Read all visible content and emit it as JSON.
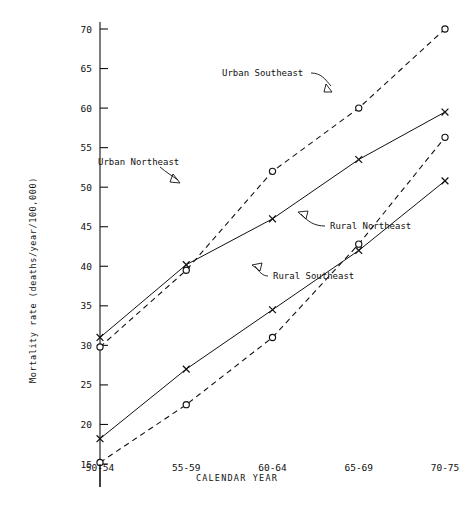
{
  "chart_data": {
    "type": "line",
    "title": "",
    "xlabel": "CALENDAR YEAR",
    "ylabel": "Mortality rate (deaths/year/100,000)",
    "categories": [
      "50-54",
      "55-59",
      "60-64",
      "65-69",
      "70-75"
    ],
    "ylim": [
      15,
      70
    ],
    "yticks": [
      15,
      20,
      25,
      30,
      35,
      40,
      45,
      50,
      55,
      60,
      65,
      70
    ],
    "ytick_labels": [
      "15",
      "20",
      "25",
      "30",
      "35",
      "40",
      "45",
      "50",
      "55",
      "60",
      "65",
      "70"
    ],
    "grid": false,
    "legend_position": "inline-annotations",
    "series": [
      {
        "name": "Urban Northeast",
        "marker": "x",
        "line_style": "solid",
        "values": [
          31.0,
          40.2,
          46.0,
          53.5,
          59.5
        ]
      },
      {
        "name": "Urban Southeast",
        "marker": "o",
        "line_style": "dashed",
        "values": [
          29.8,
          39.5,
          52.0,
          60.0,
          70.0
        ]
      },
      {
        "name": "Rural Northeast",
        "marker": "x",
        "line_style": "solid",
        "values": [
          18.2,
          27.0,
          34.5,
          42.0,
          50.8
        ]
      },
      {
        "name": "Rural Southeast",
        "marker": "o",
        "line_style": "dashed",
        "values": [
          15.2,
          22.5,
          31.0,
          42.8,
          56.3
        ]
      }
    ],
    "annotations": [
      {
        "text": "Urban Southeast",
        "series": "Urban Southeast"
      },
      {
        "text": "Urban Northeast",
        "series": "Urban Northeast"
      },
      {
        "text": "Rural Northeast",
        "series": "Rural Northeast"
      },
      {
        "text": "Rural Southeast",
        "series": "Rural Southeast"
      }
    ]
  },
  "labels": {
    "annot_urban_southeast": "Urban Southeast",
    "annot_urban_northeast": "Urban Northeast",
    "annot_rural_northeast": "Rural Northeast",
    "annot_rural_southeast": "Rural Southeast",
    "x_axis_title": "CALENDAR YEAR",
    "y_axis_title": "Mortality rate (deaths/year/100,000)"
  }
}
